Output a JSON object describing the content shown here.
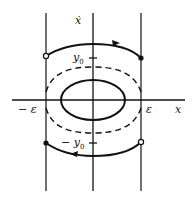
{
  "diagram": {
    "type": "phase-plane",
    "axes": {
      "horizontal_label": "x",
      "vertical_label": "ẋ"
    },
    "labels": {
      "y0": "y",
      "y0_sub": "0",
      "neg_y0": "− y",
      "neg_y0_sub": "0",
      "neg_epsilon": "− ε",
      "epsilon": "ε",
      "x_axis": "x",
      "xdot_axis": "ẋ"
    },
    "elements": [
      {
        "name": "vertical-line-left",
        "at": "x = −ε"
      },
      {
        "name": "vertical-line-right",
        "at": "x = ε"
      },
      {
        "name": "inner-closed-orbit",
        "style": "solid ellipse"
      },
      {
        "name": "separatrix-orbit",
        "style": "dashed"
      },
      {
        "name": "upper-arc",
        "from": "open dot at (−ε, y0)",
        "to": "filled dot at (ε, ·)",
        "arrow": "right"
      },
      {
        "name": "lower-arc",
        "from": "open dot at (ε, ·)",
        "to": "filled dot at (−ε, −y0)",
        "arrow": "left"
      }
    ],
    "colors": {
      "ink": "#111111",
      "background": "#ffffff"
    }
  }
}
